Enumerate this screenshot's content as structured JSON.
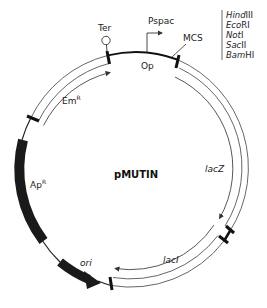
{
  "plasmid": {
    "name": "pMUTIN",
    "center": [
      136,
      170
    ],
    "radius": 118
  },
  "features": {
    "ter": {
      "label": "Ter"
    },
    "pspac": {
      "label": "Pspac"
    },
    "op": {
      "label": "Op"
    },
    "mcs": {
      "label": "MCS"
    },
    "emr": {
      "label": "Em",
      "sup": "R"
    },
    "apr": {
      "label": "Ap",
      "sup": "R"
    },
    "ori": {
      "label": "ori"
    },
    "lacz": {
      "label": "lacZ"
    },
    "laci": {
      "label": "lacI"
    }
  },
  "mcs_sites": [
    {
      "italic": "Hind",
      "roman": "III"
    },
    {
      "italic": "Eco",
      "roman": "RI"
    },
    {
      "italic": "Not",
      "roman": "I"
    },
    {
      "italic": "Sac",
      "roman": "II"
    },
    {
      "italic": "Bam",
      "roman": "HI"
    }
  ],
  "colors": {
    "line": "#333333",
    "thin": "#555555",
    "block": "#1a1a1a"
  }
}
